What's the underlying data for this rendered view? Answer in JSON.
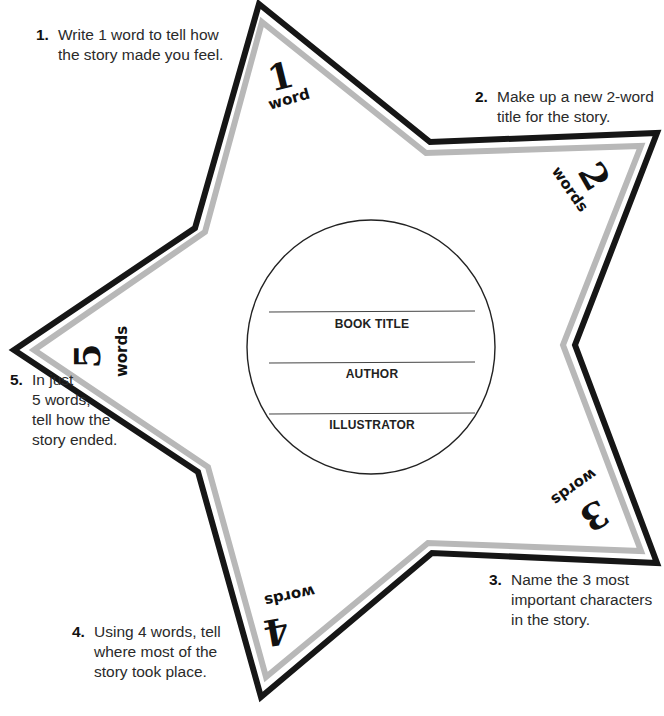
{
  "colors": {
    "outer_stroke": "#161616",
    "inner_stroke": "#b8b8b8",
    "circle_stroke": "#222222",
    "rule_line": "#444444"
  },
  "prompts": [
    {
      "number": "1.",
      "lines": [
        "Write 1 word to tell how",
        "the story made you feel."
      ]
    },
    {
      "number": "2.",
      "lines": [
        "Make up a new 2-word",
        "title for the story."
      ]
    },
    {
      "number": "3.",
      "lines": [
        "Name the 3 most",
        "important characters",
        "in the story."
      ]
    },
    {
      "number": "4.",
      "lines": [
        "Using 4 words, tell",
        "where most of the",
        "story took place."
      ]
    },
    {
      "number": "5.",
      "lines": [
        "In just",
        "5 words,",
        "tell how the",
        "story ended."
      ]
    }
  ],
  "tips": [
    {
      "numeral": "1",
      "word": "word"
    },
    {
      "numeral": "2",
      "word": "words"
    },
    {
      "numeral": "3",
      "word": "words"
    },
    {
      "numeral": "4",
      "word": "words"
    },
    {
      "numeral": "5",
      "word": "words"
    }
  ],
  "circle": {
    "fields": [
      "BOOK TITLE",
      "AUTHOR",
      "ILLUSTRATOR"
    ]
  }
}
